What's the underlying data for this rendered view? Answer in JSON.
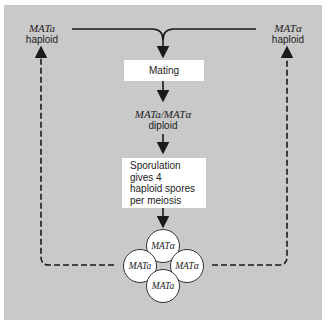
{
  "haploid_left": {
    "genotype": "MATa",
    "label": "haploid"
  },
  "haploid_right": {
    "genotype": "MATα",
    "label": "haploid"
  },
  "mating_box": {
    "label": "Mating"
  },
  "diploid": {
    "genotype": "MATa/MATα",
    "label": "diploid"
  },
  "sporulation_box": {
    "lines": [
      "Sporulation",
      "gives 4",
      "haploid spores",
      "per meiosis"
    ]
  },
  "spores": {
    "top": "MATα",
    "left": "MATa",
    "right": "MATα",
    "bottom": "MATa"
  },
  "colors": {
    "panel": "#c9c9c9",
    "box": "#ffffff",
    "line": "#1a1a1a"
  }
}
